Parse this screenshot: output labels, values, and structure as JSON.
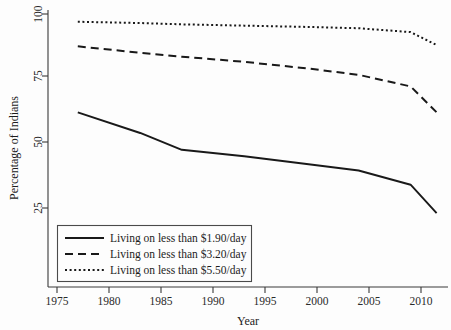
{
  "chart_data": {
    "type": "line",
    "title": "",
    "xlabel": "Year",
    "ylabel": "Percentage of Indians",
    "xlim": [
      1975,
      2012
    ],
    "ylim": [
      20,
      101
    ],
    "grid": false,
    "legend_position": "bottom-left",
    "x_ticks": [
      "1975",
      "1980",
      "1985",
      "1990",
      "1995",
      "2000",
      "2005",
      "2010"
    ],
    "x_tick_values": [
      1975,
      1980,
      1985,
      1990,
      1995,
      2000,
      2005,
      2010
    ],
    "y_ticks": [
      "25",
      "50",
      "75",
      "100"
    ],
    "y_tick_values": [
      25,
      50,
      75,
      100
    ],
    "series": [
      {
        "name": "Living on less than $1.90/day",
        "style": "solid",
        "x": [
          1977,
          1983,
          1987,
          1993,
          1999,
          2004,
          2009,
          2011.5
        ],
        "values": [
          62,
          54,
          47.5,
          45,
          42,
          39.5,
          34,
          23
        ]
      },
      {
        "name": "Living on less than $3.20/day",
        "style": "dashed",
        "x": [
          1977,
          1983,
          1987,
          1993,
          1999,
          2004,
          2009,
          2011.5
        ],
        "values": [
          87.5,
          85,
          83.5,
          81.5,
          79,
          76.5,
          72,
          62
        ]
      },
      {
        "name": "Living on less than $5.50/day",
        "style": "dotted",
        "x": [
          1977,
          1983,
          1987,
          1993,
          1999,
          2004,
          2009,
          2011.5
        ],
        "values": [
          97,
          96.5,
          96,
          95.5,
          95,
          94.5,
          93,
          88
        ]
      }
    ]
  },
  "axes": {
    "y_title": "Percentage of Indians",
    "x_title": "Year",
    "y_tick_0": "100",
    "y_tick_1": "75",
    "y_tick_2": "50",
    "y_tick_3": "25",
    "x_tick_0": "1975",
    "x_tick_1": "1980",
    "x_tick_2": "1985",
    "x_tick_3": "1990",
    "x_tick_4": "1995",
    "x_tick_5": "2000",
    "x_tick_6": "2005",
    "x_tick_7": "2010"
  },
  "legend": {
    "entry_0": "Living on less than $1.90/day",
    "entry_1": "Living on less than $3.20/day",
    "entry_2": "Living on less than $5.50/day"
  },
  "colors": {
    "line": "#191919",
    "axis": "#3a3a3a",
    "background": "#fdfdfd"
  }
}
